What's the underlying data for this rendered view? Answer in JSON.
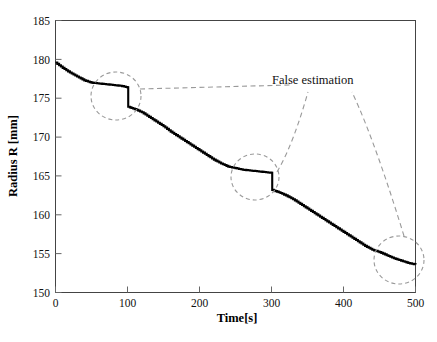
{
  "chart_data": {
    "type": "line",
    "title": "",
    "xlabel": "Time[s]",
    "ylabel": "Radius R  [mm]",
    "xlim": [
      0,
      500
    ],
    "ylim": [
      150,
      185
    ],
    "xticks": [
      0,
      100,
      200,
      300,
      400,
      500
    ],
    "yticks": [
      150,
      155,
      160,
      165,
      170,
      175,
      180,
      185
    ],
    "grid": false,
    "legend_position": "none",
    "series": [
      {
        "name": "Estimated radius",
        "x": [
          0,
          10,
          20,
          30,
          40,
          50,
          60,
          70,
          80,
          90,
          100,
          101,
          110,
          120,
          130,
          140,
          150,
          160,
          170,
          180,
          190,
          200,
          210,
          220,
          230,
          240,
          250,
          260,
          270,
          280,
          290,
          300,
          301,
          310,
          320,
          330,
          340,
          350,
          360,
          370,
          380,
          390,
          400,
          410,
          420,
          430,
          440,
          450,
          460,
          470,
          480,
          490,
          500
        ],
        "values": [
          179.6,
          178.9,
          178.3,
          177.8,
          177.3,
          177.0,
          176.9,
          176.8,
          176.7,
          176.6,
          176.4,
          173.9,
          173.6,
          173.2,
          172.6,
          172.0,
          171.4,
          170.7,
          170.1,
          169.5,
          168.9,
          168.3,
          167.7,
          167.1,
          166.6,
          166.2,
          166.0,
          165.8,
          165.7,
          165.6,
          165.5,
          165.4,
          163.2,
          162.9,
          162.5,
          162.0,
          161.4,
          160.8,
          160.2,
          159.6,
          159.0,
          158.4,
          157.8,
          157.2,
          156.6,
          156.0,
          155.5,
          155.2,
          154.8,
          154.4,
          154.1,
          153.8,
          153.6
        ]
      }
    ],
    "annotations": [
      {
        "label": "False estimation",
        "type": "text",
        "x": 330,
        "y": 181.5
      },
      {
        "type": "ellipse-marker",
        "name": "false-estimation-region-1",
        "center_x": 85,
        "center_y": 175.2
      },
      {
        "type": "ellipse-marker",
        "name": "false-estimation-region-2",
        "center_x": 278,
        "center_y": 164.8
      },
      {
        "type": "ellipse-marker",
        "name": "false-estimation-region-3",
        "center_x": 478,
        "center_y": 154.2
      }
    ]
  },
  "axis": {
    "x_title": "Time[s]",
    "y_title": "Radius R  [mm]",
    "x_tick_labels": [
      "0",
      "100",
      "200",
      "300",
      "400",
      "500"
    ],
    "y_tick_labels": [
      "150",
      "155",
      "160",
      "165",
      "170",
      "175",
      "180",
      "185"
    ]
  },
  "annotation": {
    "false_estimation_label": "False estimation"
  },
  "colors": {
    "data_line": "#000000",
    "frame": "#444444",
    "annotation": "#9a9a9a",
    "background": "#ffffff"
  }
}
